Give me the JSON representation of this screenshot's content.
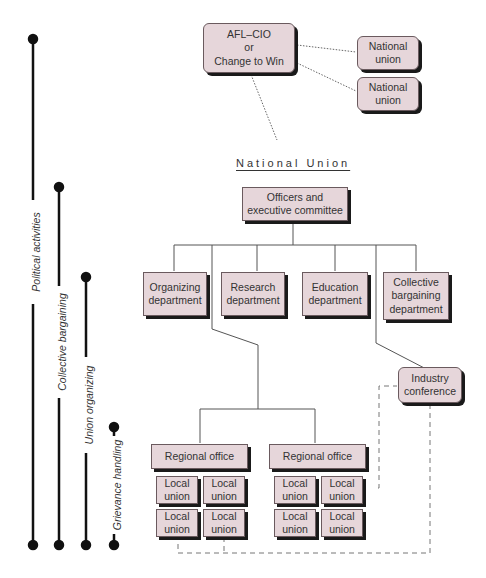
{
  "top": {
    "federation": "AFL–CIO\nor\nChange to Win",
    "national_unions": [
      "National\nunion",
      "National\nunion"
    ]
  },
  "national_union": {
    "title": "National Union",
    "officers": "Officers and\nexecutive committee",
    "departments": [
      "Organizing\ndepartment",
      "Research\ndepartment",
      "Education\ndepartment",
      "Collective\nbargaining\ndepartment"
    ],
    "industry_conference": "Industry\nconference",
    "regional_offices": [
      "Regional office",
      "Regional office"
    ],
    "local_unions": [
      "Local\nunion",
      "Local\nunion",
      "Local\nunion",
      "Local\nunion",
      "Local\nunion",
      "Local\nunion",
      "Local\nunion",
      "Local\nunion"
    ]
  },
  "activities": [
    {
      "label": "Political activities"
    },
    {
      "label": "Collective bargaining"
    },
    {
      "label": "Union organizing"
    },
    {
      "label": "Grievance handling"
    }
  ],
  "colors": {
    "box_fill": "#e6d6da",
    "box_border": "#6a5a5e",
    "shadow": "#1a1a1a",
    "line": "#555555"
  }
}
